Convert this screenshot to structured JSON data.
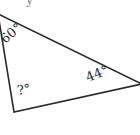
{
  "figure": {
    "type": "triangle",
    "stroke_color": "#2a2a2a",
    "background": "#ffffff",
    "vertices": {
      "top": [
        -2,
        14
      ],
      "bottom": [
        14,
        112
      ],
      "right": [
        142,
        84
      ]
    },
    "angles": {
      "top": {
        "label": "60°"
      },
      "bottom": {
        "label": "?°"
      },
      "right": {
        "label": "44°"
      }
    },
    "cropped_caption": "y"
  }
}
